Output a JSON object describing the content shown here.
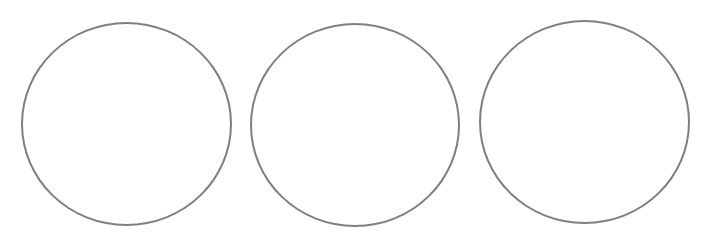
{
  "canvas": {
    "width": 703,
    "height": 245,
    "background": "#ffffff"
  },
  "shapes": [
    {
      "type": "circle",
      "stroke": "#7f7f7f",
      "fill": "none",
      "label": ""
    },
    {
      "type": "circle",
      "stroke": "#7f7f7f",
      "fill": "none",
      "label": ""
    },
    {
      "type": "circle",
      "stroke": "#7f7f7f",
      "fill": "none",
      "label": ""
    }
  ]
}
